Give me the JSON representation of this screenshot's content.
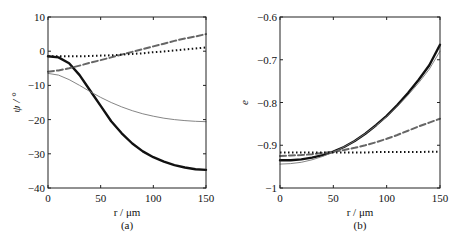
{
  "chart_data": [
    {
      "type": "line",
      "panel_label": "(a)",
      "xlabel": "r / μm",
      "ylabel": "ψ / °",
      "xlim": [
        0,
        150
      ],
      "ylim": [
        -40,
        10
      ],
      "xticks": [
        0,
        50,
        100,
        150
      ],
      "yticks": [
        10,
        0,
        -10,
        -20,
        -30,
        -40
      ],
      "xtick_labels": [
        "0",
        "50",
        "100",
        "150"
      ],
      "ytick_labels": [
        "10",
        "0",
        "−10",
        "−20",
        "−30",
        "−40"
      ],
      "grid": false,
      "x": [
        0,
        10,
        20,
        30,
        40,
        50,
        60,
        70,
        80,
        90,
        100,
        110,
        120,
        130,
        140,
        150
      ],
      "series": [
        {
          "name": "thick-solid",
          "style": "solid-thick",
          "color": "#111111",
          "values": [
            -1.5,
            -1.8,
            -3.5,
            -7,
            -11.5,
            -16,
            -20.5,
            -24,
            -27,
            -29.3,
            -31,
            -32.3,
            -33.3,
            -34,
            -34.5,
            -34.7
          ]
        },
        {
          "name": "thin-solid",
          "style": "solid-thin",
          "color": "#777777",
          "values": [
            -6.5,
            -7,
            -8.3,
            -10,
            -11.8,
            -13.5,
            -15,
            -16.3,
            -17.4,
            -18.3,
            -19,
            -19.6,
            -20,
            -20.3,
            -20.5,
            -20.6
          ]
        },
        {
          "name": "dashed",
          "style": "dashed",
          "color": "#666666",
          "values": [
            -6,
            -5.6,
            -5,
            -4.2,
            -3.4,
            -2.6,
            -1.8,
            -1,
            -0.2,
            0.6,
            1.4,
            2.2,
            3,
            3.7,
            4.3,
            5
          ]
        },
        {
          "name": "dotted",
          "style": "dotted",
          "color": "#111111",
          "values": [
            -1.5,
            -1.5,
            -1.5,
            -1.5,
            -1.4,
            -1.3,
            -1.2,
            -1,
            -0.8,
            -0.6,
            -0.3,
            -0.1,
            0.2,
            0.5,
            0.8,
            1.1
          ]
        }
      ]
    },
    {
      "type": "line",
      "panel_label": "(b)",
      "xlabel": "r / μm",
      "ylabel": "e",
      "xlim": [
        0,
        150
      ],
      "ylim": [
        -1,
        -0.6
      ],
      "xticks": [
        0,
        50,
        100,
        150
      ],
      "yticks": [
        -0.6,
        -0.7,
        -0.8,
        -0.9,
        -1
      ],
      "xtick_labels": [
        "0",
        "50",
        "100",
        "150"
      ],
      "ytick_labels": [
        "−0.6",
        "−0.7",
        "−0.8",
        "−0.9",
        "−1"
      ],
      "grid": false,
      "x": [
        0,
        10,
        20,
        30,
        40,
        50,
        60,
        70,
        80,
        90,
        100,
        110,
        120,
        130,
        140,
        150
      ],
      "series": [
        {
          "name": "thick-solid",
          "style": "solid-thick",
          "color": "#111111",
          "values": [
            -0.935,
            -0.935,
            -0.933,
            -0.929,
            -0.923,
            -0.915,
            -0.904,
            -0.89,
            -0.873,
            -0.853,
            -0.831,
            -0.806,
            -0.778,
            -0.747,
            -0.713,
            -0.665
          ]
        },
        {
          "name": "thin-solid",
          "style": "solid-thin",
          "color": "#777777",
          "values": [
            -0.944,
            -0.943,
            -0.94,
            -0.934,
            -0.926,
            -0.916,
            -0.904,
            -0.89,
            -0.873,
            -0.854,
            -0.833,
            -0.809,
            -0.783,
            -0.754,
            -0.722,
            -0.68
          ]
        },
        {
          "name": "dashed",
          "style": "dashed",
          "color": "#666666",
          "values": [
            -0.925,
            -0.924,
            -0.923,
            -0.921,
            -0.918,
            -0.915,
            -0.911,
            -0.906,
            -0.9,
            -0.893,
            -0.885,
            -0.876,
            -0.866,
            -0.856,
            -0.847,
            -0.838
          ]
        },
        {
          "name": "dotted",
          "style": "dotted",
          "color": "#111111",
          "values": [
            -0.917,
            -0.917,
            -0.917,
            -0.917,
            -0.917,
            -0.917,
            -0.917,
            -0.917,
            -0.917,
            -0.916,
            -0.916,
            -0.916,
            -0.916,
            -0.916,
            -0.915,
            -0.915
          ]
        }
      ]
    }
  ]
}
